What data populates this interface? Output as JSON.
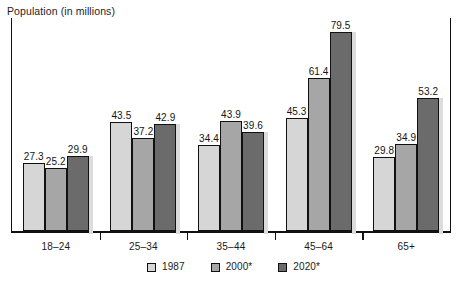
{
  "chart_data": {
    "type": "bar",
    "title": "Population (in millions)",
    "xlabel": "",
    "ylabel": "Population (in millions)",
    "ylim": [
      0,
      82
    ],
    "grid": false,
    "legend_position": "bottom-center",
    "categories": [
      "18–24",
      "25–34",
      "35–44",
      "45–64",
      "65+"
    ],
    "series": [
      {
        "name": "1987",
        "color": "#d6d6d6",
        "values": [
          27.3,
          43.5,
          34.4,
          45.3,
          29.8
        ]
      },
      {
        "name": "2000*",
        "color": "#a6a6a6",
        "values": [
          25.2,
          37.2,
          43.9,
          61.4,
          34.9
        ]
      },
      {
        "name": "2020*",
        "color": "#6b6b6b",
        "values": [
          29.9,
          42.9,
          39.6,
          79.5,
          53.2
        ]
      }
    ],
    "data_labels": [
      [
        "27.3",
        "25.2",
        "29.9"
      ],
      [
        "43.5",
        "37.2",
        "42.9"
      ],
      [
        "34.4",
        "43.9",
        "39.6"
      ],
      [
        "45.3",
        "61.4",
        "79.5"
      ],
      [
        "29.8",
        "34.9",
        "53.2"
      ]
    ],
    "annotations": [
      "* projected"
    ]
  },
  "legend": {
    "items": [
      {
        "label": "1987"
      },
      {
        "label": "2000*"
      },
      {
        "label": "2020*"
      }
    ]
  },
  "colors": {
    "series_1987": "#d6d6d6",
    "series_2000": "#a6a6a6",
    "series_2020": "#6b6b6b",
    "axis": "#111111",
    "background": "#ffffff"
  }
}
